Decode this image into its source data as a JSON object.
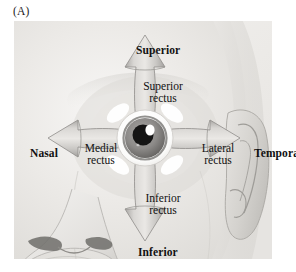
{
  "figure": {
    "panel_label": "(A)",
    "caption_labels": {
      "superior": "Superior",
      "inferior": "Inferior",
      "nasal": "Nasal",
      "temporal": "Temporal"
    },
    "muscle_labels": {
      "superior_rectus_line1": "Superior",
      "superior_rectus_line2": "rectus",
      "inferior_rectus_line1": "Inferior",
      "inferior_rectus_line2": "rectus",
      "medial_rectus_line1": "Medial",
      "medial_rectus_line2": "rectus",
      "lateral_rectus_line1": "Lateral",
      "lateral_rectus_line2": "rectus"
    },
    "colors": {
      "background": "#ffffff",
      "panel_fill": "#eeeeec",
      "face_light": "#f3f2f0",
      "face_mid": "#dedcd9",
      "face_shadow": "#c6c4c1",
      "arrow_light": "#d8d6d3",
      "arrow_mid": "#b9b7b4",
      "arrow_dark": "#9c9a97",
      "arrow_outline": "#8d8b88",
      "sclera": "#ffffff",
      "iris": "#8e8c8a",
      "pupil": "#141414",
      "highlight": "#ffffff",
      "text": "#111111"
    }
  }
}
